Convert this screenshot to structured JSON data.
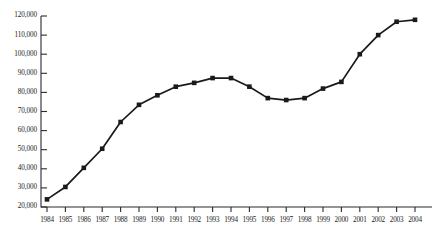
{
  "chart_data": {
    "type": "line",
    "title": "",
    "xlabel": "",
    "ylabel": "",
    "categories": [
      "1984",
      "1985",
      "1986",
      "1987",
      "1988",
      "1989",
      "1990",
      "1991",
      "1992",
      "1993",
      "1994",
      "1995",
      "1996",
      "1997",
      "1998",
      "1999",
      "2000",
      "2001",
      "2002",
      "2003",
      "2004"
    ],
    "values": [
      24000,
      30500,
      40500,
      50500,
      64500,
      73500,
      78500,
      83000,
      85000,
      87500,
      87500,
      83000,
      77000,
      76000,
      77000,
      82000,
      85500,
      100000,
      110000,
      117000,
      118000
    ],
    "series": [
      {
        "name": "series-1",
        "values": [
          24000,
          30500,
          40500,
          50500,
          64500,
          73500,
          78500,
          83000,
          85000,
          87500,
          87500,
          83000,
          77000,
          76000,
          77000,
          82000,
          85500,
          100000,
          110000,
          117000,
          118000
        ]
      }
    ],
    "ylim": [
      20000,
      120000
    ],
    "ytick_values": [
      20000,
      30000,
      40000,
      50000,
      60000,
      70000,
      80000,
      90000,
      100000,
      110000,
      120000
    ],
    "ytick_labels": [
      "20,000",
      "30,000",
      "40,000",
      "50,000",
      "60,000",
      "70,000",
      "80,000",
      "90,000",
      "100,000",
      "110,000",
      "120,000"
    ],
    "grid": false,
    "legend": null,
    "legend_position": "none",
    "marker": "filled-square",
    "line_color": "#1a1a1a",
    "marker_color": "#1a1a1a",
    "axis_color": "#2b2b2b",
    "background_color": "#ffffff"
  }
}
